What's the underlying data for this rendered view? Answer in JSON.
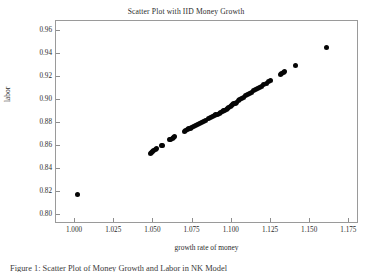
{
  "figure": {
    "title": "Scatter Plot with IID Money Growth",
    "caption": "Figure 1: Scatter Plot of Money Growth and Labor in NK Model",
    "marker_color": "#050505",
    "frame_color": "#9a9a9a",
    "background": "#ffffff"
  },
  "chart_data": {
    "type": "scatter",
    "title": "Scatter Plot with IID Money Growth",
    "xlabel": "growth rate of money",
    "ylabel": "labor",
    "xlim": [
      0.9885,
      1.1805
    ],
    "ylim": [
      0.7928,
      0.9682
    ],
    "grid": false,
    "legend": null,
    "xticks": [
      1.0,
      1.025,
      1.05,
      1.075,
      1.1,
      1.125,
      1.15,
      1.175
    ],
    "xticklabels": [
      "1.000",
      "1.025",
      "1.050",
      "1.075",
      "1.100",
      "1.125",
      "1.150",
      "1.175"
    ],
    "yticks": [
      0.8,
      0.82,
      0.84,
      0.86,
      0.88,
      0.9,
      0.92,
      0.94,
      0.96
    ],
    "yticklabels": [
      "0.80",
      "0.82",
      "0.84",
      "0.86",
      "0.88",
      "0.90",
      "0.92",
      "0.94",
      "0.96"
    ],
    "marker": "filled-circle",
    "marker_size": 5,
    "series": [
      {
        "name": "labor vs growth rate of money",
        "color": "#050505",
        "points": [
          [
            1.002,
            0.8165
          ],
          [
            1.049,
            0.853
          ],
          [
            1.0497,
            0.8538
          ],
          [
            1.0503,
            0.8545
          ],
          [
            1.051,
            0.8552
          ],
          [
            1.0518,
            0.856
          ],
          [
            1.0527,
            0.8568
          ],
          [
            1.0555,
            0.8595
          ],
          [
            1.0562,
            0.8598
          ],
          [
            1.061,
            0.8645
          ],
          [
            1.0618,
            0.8652
          ],
          [
            1.0627,
            0.866
          ],
          [
            1.0635,
            0.8667
          ],
          [
            1.0643,
            0.8672
          ],
          [
            1.0705,
            0.8718
          ],
          [
            1.0713,
            0.8725
          ],
          [
            1.0722,
            0.8733
          ],
          [
            1.073,
            0.874
          ],
          [
            1.074,
            0.8748
          ],
          [
            1.075,
            0.8755
          ],
          [
            1.076,
            0.8762
          ],
          [
            1.0772,
            0.877
          ],
          [
            1.0785,
            0.8778
          ],
          [
            1.0798,
            0.8788
          ],
          [
            1.0812,
            0.8798
          ],
          [
            1.0825,
            0.8808
          ],
          [
            1.084,
            0.8818
          ],
          [
            1.0855,
            0.8828
          ],
          [
            1.087,
            0.8838
          ],
          [
            1.0885,
            0.8852
          ],
          [
            1.0895,
            0.8858
          ],
          [
            1.0905,
            0.8862
          ],
          [
            1.0915,
            0.8868
          ],
          [
            1.0925,
            0.8875
          ],
          [
            1.0935,
            0.8882
          ],
          [
            1.0945,
            0.889
          ],
          [
            1.0955,
            0.8898
          ],
          [
            1.0963,
            0.8905
          ],
          [
            1.0972,
            0.8912
          ],
          [
            1.098,
            0.892
          ],
          [
            1.0988,
            0.8928
          ],
          [
            1.0996,
            0.8935
          ],
          [
            1.1004,
            0.8942
          ],
          [
            1.1012,
            0.895
          ],
          [
            1.102,
            0.8958
          ],
          [
            1.1028,
            0.8965
          ],
          [
            1.1038,
            0.8975
          ],
          [
            1.1048,
            0.8985
          ],
          [
            1.1058,
            0.8995
          ],
          [
            1.1068,
            0.9005
          ],
          [
            1.108,
            0.9018
          ],
          [
            1.1092,
            0.9028
          ],
          [
            1.1105,
            0.9038
          ],
          [
            1.1118,
            0.9048
          ],
          [
            1.113,
            0.9058
          ],
          [
            1.1145,
            0.9072
          ],
          [
            1.1158,
            0.9082
          ],
          [
            1.117,
            0.9092
          ],
          [
            1.1182,
            0.9102
          ],
          [
            1.1195,
            0.9112
          ],
          [
            1.121,
            0.9125
          ],
          [
            1.1225,
            0.9138
          ],
          [
            1.124,
            0.915
          ],
          [
            1.1252,
            0.916
          ],
          [
            1.1315,
            0.9215
          ],
          [
            1.1325,
            0.9225
          ],
          [
            1.1335,
            0.9232
          ],
          [
            1.1345,
            0.924
          ],
          [
            1.141,
            0.929
          ],
          [
            1.161,
            0.945
          ]
        ]
      }
    ]
  }
}
